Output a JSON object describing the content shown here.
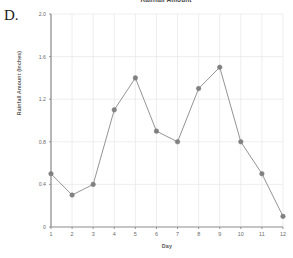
{
  "item_letter": "D.",
  "chart_data": {
    "type": "line",
    "title": "Rainfall Amount",
    "xlabel": "Day",
    "ylabel": "Rainfall Amount (Inches)",
    "x": [
      1,
      2,
      3,
      4,
      5,
      6,
      7,
      8,
      9,
      10,
      11,
      12
    ],
    "values": [
      0.5,
      0.3,
      0.4,
      1.1,
      1.4,
      0.9,
      0.8,
      1.3,
      1.5,
      0.8,
      0.5,
      0.1
    ],
    "categories": [
      "1",
      "2",
      "3",
      "4",
      "5",
      "6",
      "7",
      "8",
      "9",
      "10",
      "11",
      "12"
    ],
    "xtick_labels": [
      "1",
      "2",
      "3",
      "4",
      "5",
      "6",
      "7",
      "8",
      "9",
      "10",
      "11",
      "12"
    ],
    "ytick_labels": [
      "0",
      "0.4",
      "0.8",
      "1.2",
      "1.6",
      "2.0"
    ],
    "ytick_values": [
      0,
      0.4,
      0.8,
      1.2,
      1.6,
      2.0
    ],
    "ylim": [
      0,
      2.0
    ],
    "xlim": [
      1,
      12
    ],
    "grid": true,
    "legend": false,
    "marker": "circle",
    "line_color": "#888888",
    "marker_color": "#808080",
    "grid_color": "#e6e6e6",
    "axis_color": "#8c8c8c"
  }
}
